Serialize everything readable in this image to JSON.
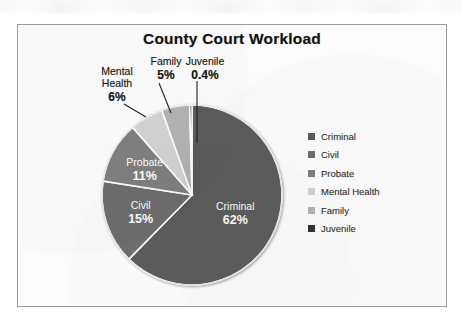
{
  "scan": {
    "background": "#ffffff",
    "frame_border_color": "#9a9a9a",
    "frame_fill": "#fdfdfd"
  },
  "chart_data": {
    "type": "pie",
    "title": "County Court Workload",
    "xlabel": "",
    "ylabel": "",
    "legend_position": "right",
    "grid": false,
    "start_angle_deg": 0,
    "direction": "clockwise",
    "categories": [
      "Criminal",
      "Civil",
      "Probate",
      "Mental Health",
      "Family",
      "Juvenile"
    ],
    "values": [
      62,
      15,
      11,
      6,
      5,
      0.4
    ],
    "labels": [
      "62%",
      "15%",
      "11%",
      "6%",
      "5%",
      "0.4%"
    ],
    "colors": [
      "#5c5c5c",
      "#6e6e6e",
      "#808080",
      "#d3d3d3",
      "#b3b3b3",
      "#333333"
    ],
    "slices": [
      {
        "name": "Criminal",
        "value": 62,
        "label": "62%",
        "color": "#5c5c5c",
        "label_placement": "inside",
        "label_color": "#ffffff"
      },
      {
        "name": "Civil",
        "value": 15,
        "label": "15%",
        "color": "#6e6e6e",
        "label_placement": "inside",
        "label_color": "#ffffff"
      },
      {
        "name": "Probate",
        "value": 11,
        "label": "11%",
        "color": "#808080",
        "label_placement": "inside",
        "label_color": "#ffffff"
      },
      {
        "name": "Mental Health",
        "value": 6,
        "label": "6%",
        "color": "#d3d3d3",
        "label_placement": "outside",
        "label_color": "#141414"
      },
      {
        "name": "Family",
        "value": 5,
        "label": "5%",
        "color": "#b3b3b3",
        "label_placement": "outside",
        "label_color": "#141414"
      },
      {
        "name": "Juvenile",
        "value": 0.4,
        "label": "0.4%",
        "color": "#333333",
        "label_placement": "outside",
        "label_color": "#141414"
      }
    ]
  },
  "title": "County Court Workload",
  "inside_labels": {
    "criminal": {
      "name": "Criminal",
      "pct": "62%"
    },
    "civil": {
      "name": "Civil",
      "pct": "15%"
    },
    "probate": {
      "name": "Probate",
      "pct": "11%"
    }
  },
  "outside_labels": {
    "mental_health": {
      "line1": "Mental",
      "line2": "Health",
      "pct": "6%"
    },
    "family": {
      "line1": "Family",
      "pct": "5%"
    },
    "juvenile": {
      "line1": "Juvenile",
      "pct": "0.4%"
    }
  },
  "legend": {
    "items": [
      {
        "label": "Criminal",
        "color": "#5c5c5c"
      },
      {
        "label": "Civil",
        "color": "#6e6e6e"
      },
      {
        "label": "Probate",
        "color": "#808080"
      },
      {
        "label": "Mental Health",
        "color": "#d3d3d3"
      },
      {
        "label": "Family",
        "color": "#b3b3b3"
      },
      {
        "label": "Juvenile",
        "color": "#333333"
      }
    ]
  }
}
